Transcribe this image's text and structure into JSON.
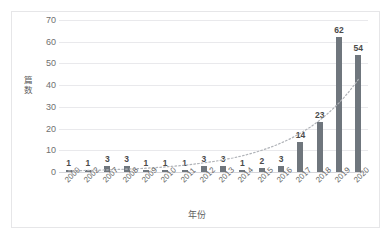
{
  "chart_data": {
    "type": "bar",
    "title": "",
    "xlabel": "年份",
    "ylabel": "篇数",
    "categories": [
      "2000",
      "2002",
      "2007",
      "2008",
      "2009",
      "2010",
      "2011",
      "2012",
      "2013",
      "2014",
      "2015",
      "2016",
      "2017",
      "2018",
      "2019",
      "2020"
    ],
    "values": [
      1,
      1,
      3,
      3,
      1,
      1,
      1,
      3,
      3,
      1,
      2,
      3,
      14,
      23,
      62,
      54
    ],
    "series": [
      {
        "name": "篇数",
        "values": [
          1,
          1,
          3,
          3,
          1,
          1,
          1,
          3,
          3,
          1,
          2,
          3,
          14,
          23,
          62,
          54
        ]
      }
    ],
    "ylim": [
      0,
      70
    ],
    "yticks": [
      0,
      10,
      20,
      30,
      40,
      50,
      60,
      70
    ],
    "ytick_labels": [
      "0",
      "10",
      "20",
      "30",
      "40",
      "50",
      "60",
      "70"
    ],
    "grid": true,
    "legend": "none",
    "data_labels": [
      "1",
      "1",
      "3",
      "3",
      "1",
      "1",
      "1",
      "3",
      "3",
      "1",
      "2",
      "3",
      "14",
      "23",
      "62",
      "54"
    ],
    "annotations": [
      {
        "name": "trendline",
        "style": "dotted",
        "description": "递增趋势线"
      }
    ],
    "colors": {
      "bar": "#6f767d",
      "gridline": "#e9e9ec",
      "axis": "#d6d6da",
      "label_text": "#4a4a4a",
      "tick_text": "#6f6f6f",
      "trendline": "#b0b3b8",
      "frame_border": "#e6e6e8",
      "background": "#ffffff"
    }
  }
}
